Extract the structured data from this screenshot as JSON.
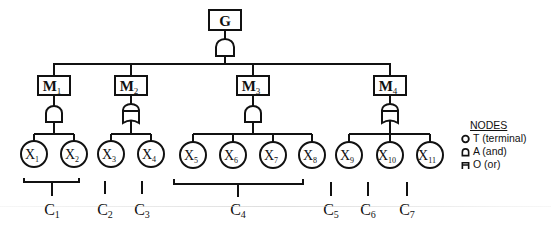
{
  "root": {
    "label": "G",
    "gate": "and"
  },
  "modules": [
    {
      "id": "M1",
      "base": "M",
      "sub": "1",
      "gate": "and",
      "cx": 54,
      "children": [
        0,
        1
      ]
    },
    {
      "id": "M2",
      "base": "M",
      "sub": "2",
      "gate": "or",
      "cx": 131,
      "children": [
        2,
        3
      ]
    },
    {
      "id": "M3",
      "base": "M",
      "sub": "3",
      "gate": "and",
      "cx": 253,
      "children": [
        4,
        5,
        6,
        7
      ]
    },
    {
      "id": "M4",
      "base": "M",
      "sub": "4",
      "gate": "or",
      "cx": 390,
      "children": [
        8,
        9,
        10
      ]
    }
  ],
  "terminals": [
    {
      "base": "X",
      "sub": "1"
    },
    {
      "base": "X",
      "sub": "2"
    },
    {
      "base": "X",
      "sub": "3"
    },
    {
      "base": "X",
      "sub": "4"
    },
    {
      "base": "X",
      "sub": "5"
    },
    {
      "base": "X",
      "sub": "6"
    },
    {
      "base": "X",
      "sub": "7"
    },
    {
      "base": "X",
      "sub": "8"
    },
    {
      "base": "X",
      "sub": "9"
    },
    {
      "base": "X",
      "sub": "10"
    },
    {
      "base": "X",
      "sub": "11"
    }
  ],
  "groups": [
    {
      "base": "C",
      "sub": "1"
    },
    {
      "base": "C",
      "sub": "2"
    },
    {
      "base": "C",
      "sub": "3"
    },
    {
      "base": "C",
      "sub": "4"
    },
    {
      "base": "C",
      "sub": "5"
    },
    {
      "base": "C",
      "sub": "6"
    },
    {
      "base": "C",
      "sub": "7"
    }
  ],
  "legend": {
    "title": "NODES",
    "items": [
      {
        "icon": "circle-icon",
        "label": "T (terminal)"
      },
      {
        "icon": "and-gate-icon",
        "label": "A (and)"
      },
      {
        "icon": "or-gate-icon",
        "label": "O (or)"
      }
    ]
  }
}
